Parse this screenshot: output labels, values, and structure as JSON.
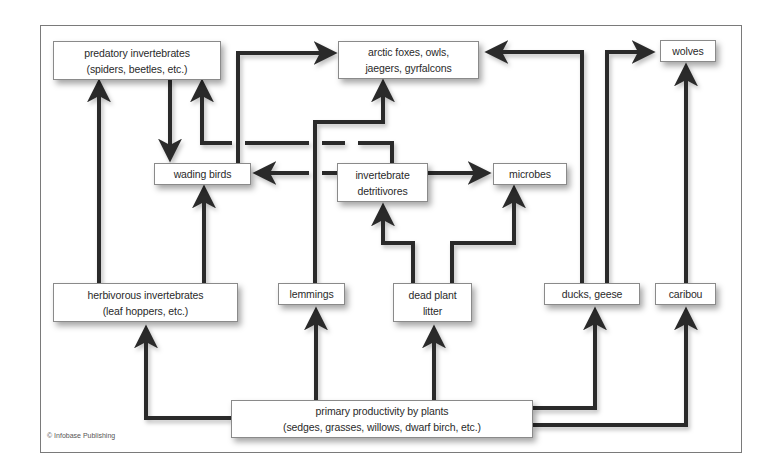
{
  "diagram": {
    "type": "food-web",
    "colors": {
      "arrow": "#2b2b2b",
      "box_border": "#8a8a8a",
      "frame": "#7a7a7a",
      "text": "#2a2a2a"
    },
    "nodes": {
      "predatory_invertebrates": {
        "line1": "predatory invertebrates",
        "line2": "(spiders, beetles, etc.)"
      },
      "arctic_predators": {
        "line1": "arctic foxes, owls,",
        "line2": "jaegers, gyrfalcons"
      },
      "wolves": {
        "line1": "wolves"
      },
      "wading_birds": {
        "line1": "wading birds"
      },
      "invertebrate_detritivores": {
        "line1": "invertebrate",
        "line2": "detritivores"
      },
      "microbes": {
        "line1": "microbes"
      },
      "herbivorous_invertebrates": {
        "line1": "herbivorous invertebrates",
        "line2": "(leaf hoppers, etc.)"
      },
      "lemmings": {
        "line1": "lemmings"
      },
      "dead_plant_litter": {
        "line1": "dead plant",
        "line2": "litter"
      },
      "ducks_geese": {
        "line1": "ducks, geese"
      },
      "caribou": {
        "line1": "caribou"
      },
      "primary_productivity": {
        "line1": "primary productivity by plants",
        "line2": "(sedges, grasses, willows, dwarf birch, etc.)"
      }
    },
    "edges": [
      {
        "from": "primary_productivity",
        "to": "herbivorous_invertebrates"
      },
      {
        "from": "primary_productivity",
        "to": "lemmings"
      },
      {
        "from": "primary_productivity",
        "to": "dead_plant_litter"
      },
      {
        "from": "primary_productivity",
        "to": "ducks_geese"
      },
      {
        "from": "primary_productivity",
        "to": "caribou"
      },
      {
        "from": "herbivorous_invertebrates",
        "to": "predatory_invertebrates"
      },
      {
        "from": "herbivorous_invertebrates",
        "to": "wading_birds"
      },
      {
        "from": "predatory_invertebrates",
        "to": "wading_birds"
      },
      {
        "from": "invertebrate_detritivores",
        "to": "predatory_invertebrates"
      },
      {
        "from": "invertebrate_detritivores",
        "to": "wading_birds"
      },
      {
        "from": "invertebrate_detritivores",
        "to": "microbes"
      },
      {
        "from": "dead_plant_litter",
        "to": "invertebrate_detritivores"
      },
      {
        "from": "dead_plant_litter",
        "to": "microbes"
      },
      {
        "from": "wading_birds",
        "to": "arctic_predators"
      },
      {
        "from": "lemmings",
        "to": "arctic_predators"
      },
      {
        "from": "ducks_geese",
        "to": "arctic_predators"
      },
      {
        "from": "ducks_geese",
        "to": "wolves"
      },
      {
        "from": "caribou",
        "to": "wolves"
      }
    ],
    "credit": "© Infobase Publishing"
  }
}
